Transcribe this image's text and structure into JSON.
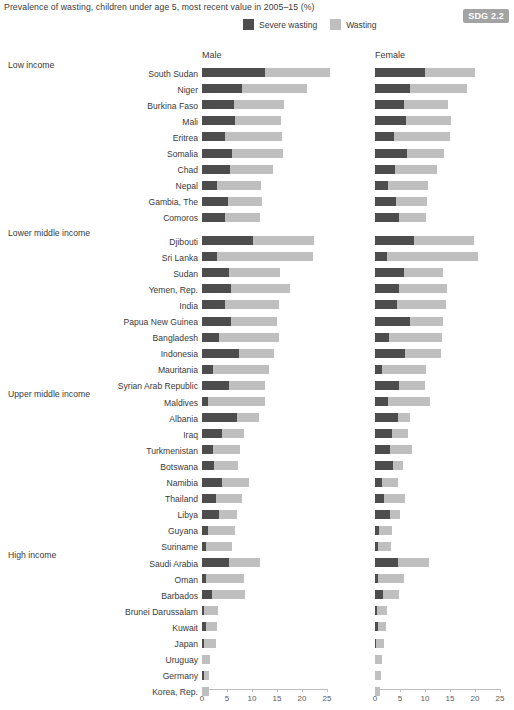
{
  "header": {
    "subtitle": "Prevalence of wasting, children under age 5, most recent value in 2005–15 (%)",
    "badge": "SDG 2.2"
  },
  "legend": {
    "items": [
      {
        "label": "Severe wasting",
        "color": "#4d4d4d"
      },
      {
        "label": "Wasting",
        "color": "#bfbfbf"
      }
    ]
  },
  "panels": {
    "male": "Male",
    "female": "Female"
  },
  "colors": {
    "severe": "#4d4d4d",
    "wasting": "#bfbfbf",
    "axis": "#bdbdbd",
    "badge_bg": "#a3a3a3",
    "text": "#3a3a3a"
  },
  "axis": {
    "ticks": [
      0,
      5,
      10,
      15,
      20,
      25
    ],
    "min": 0,
    "max": 27,
    "px_per_unit": 5.0,
    "male_origin_x": 202,
    "female_origin_x": 375,
    "baseline_y": 689
  },
  "chart_data": {
    "type": "bar",
    "orientation": "horizontal",
    "stacked": true,
    "title": "Prevalence of wasting, children under age 5, most recent value in 2005–15 (%)",
    "xlabel": "",
    "ylabel": "",
    "xlim": [
      0,
      27
    ],
    "grid": false,
    "legend_position": "top",
    "series": [
      {
        "name": "Severe wasting",
        "color": "#4d4d4d"
      },
      {
        "name": "Wasting",
        "color": "#bfbfbf"
      }
    ],
    "panels": [
      "Male",
      "Female"
    ],
    "groups": [
      {
        "label": "Low income",
        "top": 68,
        "rows": [
          {
            "country": "South Sudan",
            "male_severe": 12.6,
            "male_total": 25.6,
            "female_severe": 10.0,
            "female_total": 20.0
          },
          {
            "country": "Niger",
            "male_severe": 8.0,
            "male_total": 21.0,
            "female_severe": 7.0,
            "female_total": 18.4
          },
          {
            "country": "Burkina Faso",
            "male_severe": 6.4,
            "male_total": 16.4,
            "female_severe": 5.8,
            "female_total": 14.6
          },
          {
            "country": "Mali",
            "male_severe": 6.6,
            "male_total": 15.8,
            "female_severe": 6.2,
            "female_total": 15.2
          },
          {
            "country": "Eritrea",
            "male_severe": 4.6,
            "male_total": 16.0,
            "female_severe": 3.8,
            "female_total": 15.0
          },
          {
            "country": "Somalia",
            "male_severe": 6.0,
            "male_total": 16.2,
            "female_severe": 6.4,
            "female_total": 13.8
          },
          {
            "country": "Chad",
            "male_severe": 5.6,
            "male_total": 14.2,
            "female_severe": 4.0,
            "female_total": 12.4
          },
          {
            "country": "Nepal",
            "male_severe": 3.0,
            "male_total": 11.8,
            "female_severe": 2.6,
            "female_total": 10.6
          },
          {
            "country": "Gambia, The",
            "male_severe": 5.2,
            "male_total": 12.0,
            "female_severe": 4.2,
            "female_total": 10.4
          },
          {
            "country": "Comoros",
            "male_severe": 4.6,
            "male_total": 11.6,
            "female_severe": 4.8,
            "female_total": 10.2
          }
        ]
      },
      {
        "label": "Lower middle income",
        "top": 236,
        "rows": [
          {
            "country": "Djibouti",
            "male_severe": 10.2,
            "male_total": 22.4,
            "female_severe": 7.8,
            "female_total": 19.8
          },
          {
            "country": "Sri Lanka",
            "male_severe": 3.0,
            "male_total": 22.2,
            "female_severe": 2.4,
            "female_total": 20.6
          },
          {
            "country": "Sudan",
            "male_severe": 5.4,
            "male_total": 15.6,
            "female_severe": 5.8,
            "female_total": 13.6
          },
          {
            "country": "Yemen, Rep.",
            "male_severe": 5.8,
            "male_total": 17.6,
            "female_severe": 4.8,
            "female_total": 14.4
          },
          {
            "country": "India",
            "male_severe": 4.6,
            "male_total": 15.4,
            "female_severe": 4.4,
            "female_total": 14.2
          },
          {
            "country": "Papua New Guinea",
            "male_severe": 5.8,
            "male_total": 15.0,
            "female_severe": 7.0,
            "female_total": 13.6
          },
          {
            "country": "Bangladesh",
            "male_severe": 3.4,
            "male_total": 15.4,
            "female_severe": 2.8,
            "female_total": 13.4
          },
          {
            "country": "Indonesia",
            "male_severe": 7.4,
            "male_total": 14.4,
            "female_severe": 6.0,
            "female_total": 13.2
          },
          {
            "country": "Mauritania",
            "male_severe": 2.2,
            "male_total": 13.4,
            "female_severe": 1.4,
            "female_total": 10.2
          },
          {
            "country": "Syrian Arab Republic",
            "male_severe": 5.4,
            "male_total": 12.6,
            "female_severe": 4.8,
            "female_total": 10.0
          }
        ]
      },
      {
        "label": "Upper middle income",
        "top": 397,
        "rows": [
          {
            "country": "Maldives",
            "male_severe": 1.2,
            "male_total": 12.6,
            "female_severe": 2.6,
            "female_total": 11.0
          },
          {
            "country": "Albania",
            "male_severe": 7.0,
            "male_total": 11.4,
            "female_severe": 4.6,
            "female_total": 7.0
          },
          {
            "country": "Iraq",
            "male_severe": 4.0,
            "male_total": 8.4,
            "female_severe": 3.4,
            "female_total": 6.6
          },
          {
            "country": "Turkmenistan",
            "male_severe": 2.2,
            "male_total": 7.6,
            "female_severe": 3.0,
            "female_total": 7.4
          },
          {
            "country": "Botswana",
            "male_severe": 2.4,
            "male_total": 7.2,
            "female_severe": 3.6,
            "female_total": 5.6
          },
          {
            "country": "Namibia",
            "male_severe": 4.0,
            "male_total": 9.4,
            "female_severe": 1.4,
            "female_total": 4.6
          },
          {
            "country": "Thailand",
            "male_severe": 2.8,
            "male_total": 8.0,
            "female_severe": 1.8,
            "female_total": 6.0
          },
          {
            "country": "Libya",
            "male_severe": 3.4,
            "male_total": 7.0,
            "female_severe": 3.0,
            "female_total": 5.0
          },
          {
            "country": "Guyana",
            "male_severe": 1.2,
            "male_total": 6.6,
            "female_severe": 0.8,
            "female_total": 3.4
          },
          {
            "country": "Suriname",
            "male_severe": 0.8,
            "male_total": 6.0,
            "female_severe": 0.6,
            "female_total": 3.2
          }
        ]
      },
      {
        "label": "High income",
        "top": 558,
        "rows": [
          {
            "country": "Saudi Arabia",
            "male_severe": 5.4,
            "male_total": 11.6,
            "female_severe": 4.6,
            "female_total": 10.8
          },
          {
            "country": "Oman",
            "male_severe": 0.8,
            "male_total": 8.4,
            "female_severe": 0.6,
            "female_total": 5.8
          },
          {
            "country": "Barbados",
            "male_severe": 2.0,
            "male_total": 8.6,
            "female_severe": 1.6,
            "female_total": 4.8
          },
          {
            "country": "Brunei Darussalam",
            "male_severe": 0.4,
            "male_total": 3.2,
            "female_severe": 0.4,
            "female_total": 2.4
          },
          {
            "country": "Kuwait",
            "male_severe": 0.7,
            "male_total": 3.0,
            "female_severe": 0.5,
            "female_total": 2.2
          },
          {
            "country": "Japan",
            "male_severe": 0.3,
            "male_total": 2.8,
            "female_severe": 0.2,
            "female_total": 1.8
          },
          {
            "country": "Uruguay",
            "male_severe": 0.0,
            "male_total": 1.6,
            "female_severe": 0.0,
            "female_total": 1.4
          },
          {
            "country": "Germany",
            "male_severe": 0.3,
            "male_total": 1.4,
            "female_severe": 0.0,
            "female_total": 1.2
          },
          {
            "country": "Korea, Rep.",
            "male_severe": 0.0,
            "male_total": 1.4,
            "female_severe": 0.0,
            "female_total": 1.0
          }
        ]
      }
    ]
  }
}
